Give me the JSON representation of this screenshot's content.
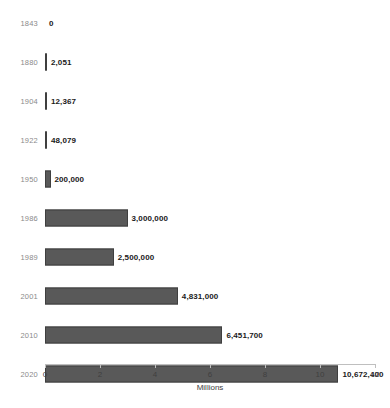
{
  "chart_data": {
    "type": "bar",
    "orientation": "horizontal",
    "title": "",
    "xlabel": "Millions",
    "ylabel": "",
    "xlim": [
      0,
      12
    ],
    "xticks": [
      0,
      2,
      4,
      6,
      8,
      10,
      12
    ],
    "xtick_labels": [
      "0",
      "2",
      "4",
      "6",
      "8",
      "10",
      "12"
    ],
    "grid": false,
    "legend": false,
    "units": "Millions",
    "categories": [
      "1843",
      "1880",
      "1904",
      "1922",
      "1950",
      "1986",
      "1989",
      "2001",
      "2010",
      "2020"
    ],
    "values": [
      0,
      2051,
      12367,
      48079,
      200000,
      3000000,
      2500000,
      4831000,
      6451700,
      10672400
    ],
    "value_labels": [
      "0",
      "2,051",
      "12,367",
      "48,079",
      "200,000",
      "3,000,000",
      "2,500,000",
      "4,831,000",
      "6,451,700",
      "10,672,400"
    ],
    "bars": [
      {
        "category": "1843",
        "value": 0,
        "label": "0"
      },
      {
        "category": "1880",
        "value": 2051,
        "label": "2,051"
      },
      {
        "category": "1904",
        "value": 12367,
        "label": "12,367"
      },
      {
        "category": "1922",
        "value": 48079,
        "label": "48,079"
      },
      {
        "category": "1950",
        "value": 200000,
        "label": "200,000"
      },
      {
        "category": "1986",
        "value": 3000000,
        "label": "3,000,000"
      },
      {
        "category": "1989",
        "value": 2500000,
        "label": "2,500,000"
      },
      {
        "category": "2001",
        "value": 4831000,
        "label": "4,831,000"
      },
      {
        "category": "2010",
        "value": 6451700,
        "label": "6,451,700"
      },
      {
        "category": "2020",
        "value": 10672400,
        "label": "10,672,400"
      }
    ],
    "colors": {
      "bar_fill": "#595959",
      "bar_border": "#3f3f3f",
      "axis_line": "#bfbfbf",
      "category_text": "#8a8a8a",
      "value_text": "#1a1a1a",
      "tick_text": "#404040",
      "background": "#ffffff"
    }
  }
}
